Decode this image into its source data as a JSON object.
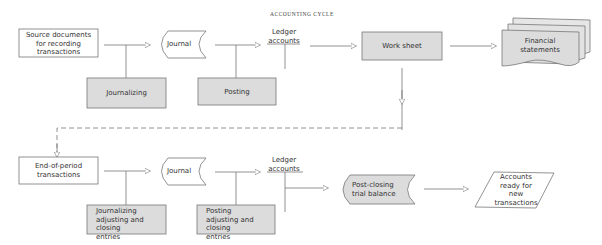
{
  "title": "ACCOUNTING CYCLE",
  "colors": {
    "shaded_fill": "#dcdcdc",
    "stroke": "#777777",
    "text": "#333333",
    "background": "#ffffff"
  },
  "top_row": {
    "source_documents": "Source documents for recording transactions",
    "source_lines": [
      "Source documents",
      "for recording",
      "transactions"
    ],
    "journal": "Journal",
    "journalizing": "Journalizing",
    "posting": "Posting",
    "ledger_lines": [
      "Ledger",
      "accounts"
    ],
    "work_sheet": "Work sheet",
    "financial_lines": [
      "Financial",
      "statements"
    ]
  },
  "bottom_row": {
    "end_of_period_lines": [
      "End-of-period",
      "transactions"
    ],
    "journal": "Journal",
    "journalizing_lines": [
      "Journalizing",
      "adjusting and closing",
      "entries"
    ],
    "posting_lines": [
      "Posting",
      "adjusting and closing",
      "entries"
    ],
    "ledger_lines": [
      "Ledger",
      "accounts"
    ],
    "post_closing_lines": [
      "Post-closing",
      "trial balance"
    ],
    "accounts_ready_lines": [
      "Accounts",
      "ready for",
      "new",
      "transactions"
    ]
  }
}
